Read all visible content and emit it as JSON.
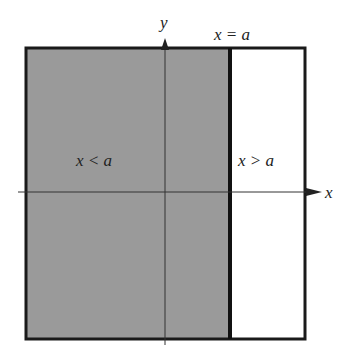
{
  "diagram": {
    "axes": {
      "x_label": "x",
      "y_label": "y"
    },
    "boundary_label": "x = a",
    "regions": [
      {
        "label": "x < a",
        "shaded": true,
        "fill": "#9a9a9a"
      },
      {
        "label": "x > a",
        "shaded": false,
        "fill": "#ffffff"
      }
    ],
    "colors": {
      "stroke": "#1a1a1a",
      "shaded": "#9a9a9a",
      "background": "#ffffff"
    }
  }
}
